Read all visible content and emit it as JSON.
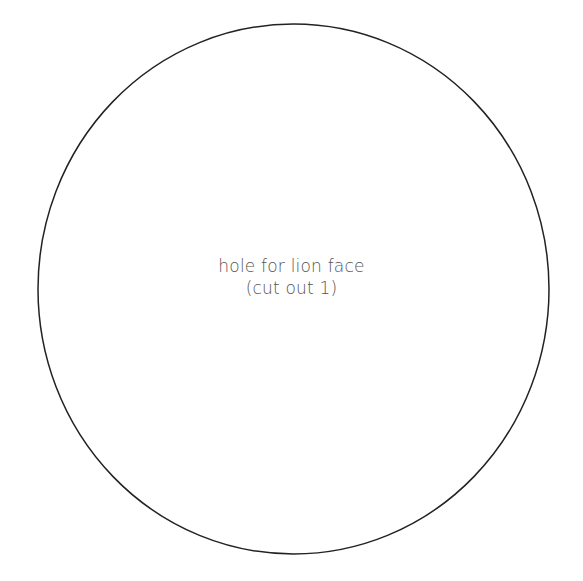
{
  "diagram": {
    "shape": "circle",
    "stroke_color": "#222222",
    "label_lines": [
      "hole for lion face",
      "(cut out 1)"
    ]
  }
}
